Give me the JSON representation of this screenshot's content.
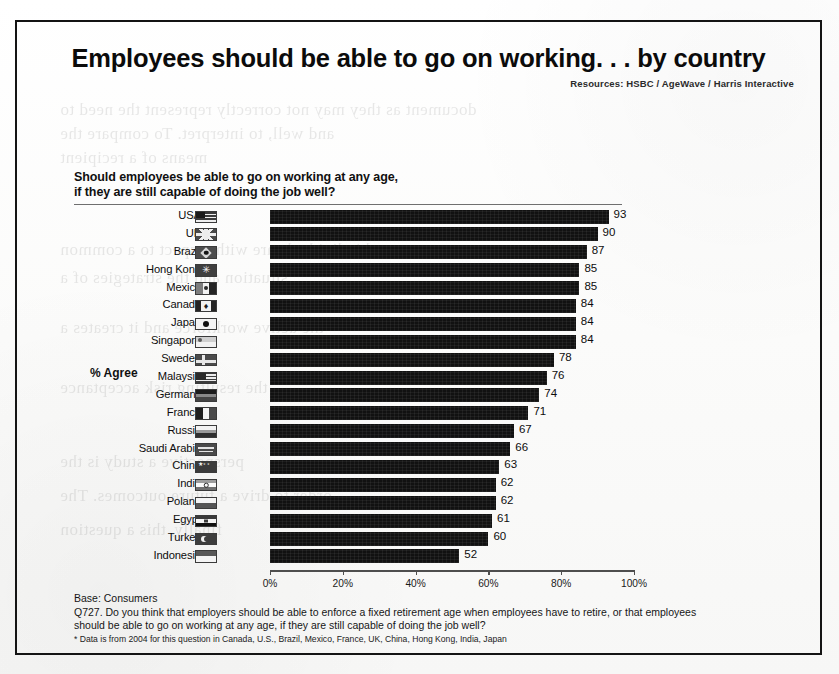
{
  "page": {
    "title": "Employees should be able to go on working. . . by country",
    "resources": "Resources:  HSBC / AgeWave / Harris Interactive"
  },
  "question": {
    "line1": "Should employees be able to go on working at any age,",
    "line2": "if they are still capable of doing the job well?"
  },
  "axis": {
    "series_label": "% Agree",
    "ticks": [
      "0%",
      "20%",
      "40%",
      "60%",
      "80%",
      "100%"
    ]
  },
  "footer": {
    "base": "Base: Consumers",
    "question": "Q727. Do you think that employers should be able to enforce a fixed retirement age when employees have to retire, or that employees should be able to go on working at any age, if they are still capable of doing the job well?",
    "note": "* Data is from 2004 for this question in Canada, U.S., Brazil, Mexico, France, UK, China, Hong Kong, India, Japan"
  },
  "chart_data": {
    "type": "bar",
    "orientation": "horizontal",
    "title": "Employees should be able to go on working. . . by country",
    "xlabel": "",
    "ylabel": "% Agree",
    "xlim": [
      0,
      100
    ],
    "xticks": [
      0,
      20,
      40,
      60,
      80,
      100
    ],
    "grid": false,
    "legend": "none",
    "bar_color": "#111111",
    "categories": [
      "USA",
      "UK",
      "Brazil",
      "Hong Kong",
      "Mexico",
      "Canada",
      "Japan",
      "Singapore",
      "Sweden",
      "Malaysia",
      "Germany",
      "France",
      "Russia",
      "Saudi Arabia",
      "China",
      "India",
      "Poland",
      "Egypt",
      "Turkey",
      "Indonesia"
    ],
    "values": [
      93,
      90,
      87,
      85,
      85,
      84,
      84,
      84,
      78,
      76,
      74,
      71,
      67,
      66,
      63,
      62,
      62,
      61,
      60,
      52
    ],
    "flags": [
      "usa",
      "uk",
      "brazil",
      "hk",
      "mexico",
      "canada",
      "japan",
      "singapore",
      "sweden",
      "malaysia",
      "germany",
      "france",
      "russia",
      "saudi",
      "china",
      "india",
      "poland",
      "egypt",
      "turkey",
      "indonesia"
    ]
  },
  "bleed_text": [
    "document as they may not correctly represent the need to",
    "and well, to interpret. To compare the",
    "means of a recipient",
    "and individuals are with respect to a common",
    "situation and the strategies of a",
    "the active workforce and it creates a",
    "the resulting risk acceptance",
    "perspective a study is the",
    "order to drive a future outcomes. The",
    "finally, this a question"
  ]
}
